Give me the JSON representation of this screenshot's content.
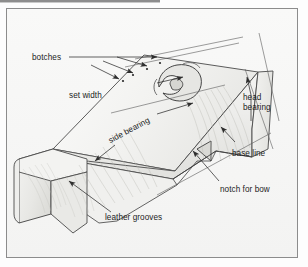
{
  "figure": {
    "kind": "technical-line-drawing",
    "background_color": "#f7f7f6",
    "frame_color": "#8c8c8c",
    "ink_color": "#3a3a3a",
    "label_color": "#1d1d1d"
  },
  "labels": {
    "botches": "botches",
    "set_width": "set width",
    "head_bearing": "head bearing",
    "base_line": "base line",
    "notch_for_bow": "notch for bow",
    "side_bearing": "side bearing",
    "leather_grooves": "leather grooves"
  },
  "leaders": {
    "botches_arrowheads": 3,
    "set_width_arrowheads": 2,
    "head_bearing_arrowheads": 1,
    "base_line_arrowheads": 1,
    "notch_for_bow_arrowheads": 1,
    "side_bearing_arrowheads": 1,
    "leather_grooves_arrowheads": 1
  }
}
